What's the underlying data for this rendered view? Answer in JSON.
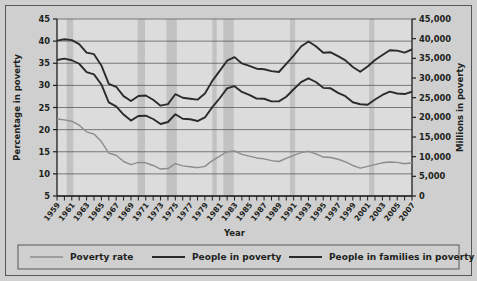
{
  "figure": {
    "background_color": "#cfcfcf",
    "plot_background_color": "#dcdcdc",
    "recession_band_color": "#c2c2c2",
    "frame_color": "#55585a"
  },
  "chart_data": {
    "type": "line",
    "title": "",
    "xlabel": "Year",
    "ylabel": "Percentage in poverty",
    "y2label": "Millions in poverty",
    "grid": true,
    "legend_position": "bottom",
    "xlim": [
      1959,
      2007
    ],
    "ylim": [
      5,
      45
    ],
    "y2lim": [
      0,
      45000
    ],
    "ytick_labels": [
      "45",
      "40",
      "35",
      "30",
      "25",
      "20",
      "15",
      "10",
      "5"
    ],
    "ytick_values": [
      45,
      40,
      35,
      30,
      25,
      20,
      15,
      10,
      5
    ],
    "y2tick_labels": [
      "45,000",
      "40,000",
      "35,000",
      "30,000",
      "25,000",
      "20,000",
      "15,000",
      "10,000",
      "5,000",
      "0"
    ],
    "y2tick_values": [
      45000,
      40000,
      35000,
      30000,
      25000,
      20000,
      15000,
      10000,
      5000,
      0
    ],
    "x": [
      1959,
      1960,
      1961,
      1962,
      1963,
      1964,
      1965,
      1966,
      1967,
      1968,
      1969,
      1970,
      1971,
      1972,
      1973,
      1974,
      1975,
      1976,
      1977,
      1978,
      1979,
      1980,
      1981,
      1982,
      1983,
      1984,
      1985,
      1986,
      1987,
      1988,
      1989,
      1990,
      1991,
      1992,
      1993,
      1994,
      1995,
      1996,
      1997,
      1998,
      1999,
      2000,
      2001,
      2002,
      2003,
      2004,
      2005,
      2006,
      2007
    ],
    "xtick_labels": [
      "1959",
      "1961",
      "1963",
      "1965",
      "1967",
      "1969",
      "1971",
      "1973",
      "1975",
      "1977",
      "1979",
      "1981",
      "1983",
      "1985",
      "1987",
      "1989",
      "1991",
      "1993",
      "1995",
      "1997",
      "1999",
      "2001",
      "2003",
      "2005",
      "2007"
    ],
    "series": [
      {
        "name": "Poverty rate",
        "axis": "left",
        "units": "percent",
        "color": "#8c8c8c",
        "line_width": 1.4,
        "values": [
          22.4,
          22.2,
          21.9,
          21.0,
          19.5,
          19.0,
          17.3,
          14.7,
          14.2,
          12.8,
          12.1,
          12.6,
          12.5,
          11.9,
          11.1,
          11.2,
          12.3,
          11.8,
          11.6,
          11.4,
          11.7,
          13.0,
          14.0,
          15.0,
          15.2,
          14.4,
          14.0,
          13.6,
          13.4,
          13.0,
          12.8,
          13.5,
          14.2,
          14.8,
          15.1,
          14.5,
          13.8,
          13.7,
          13.3,
          12.7,
          11.9,
          11.3,
          11.7,
          12.1,
          12.5,
          12.7,
          12.6,
          12.3,
          12.5
        ]
      },
      {
        "name": "People in poverty",
        "axis": "right",
        "units": "thousands",
        "color": "#2b2b2b",
        "line_width": 1.9,
        "values": [
          39490,
          39851,
          39628,
          38625,
          36436,
          36055,
          33185,
          28510,
          27769,
          25389,
          24147,
          25420,
          25559,
          24460,
          22973,
          23370,
          25877,
          24975,
          24720,
          24497,
          26072,
          29272,
          31822,
          34398,
          35303,
          33700,
          33064,
          32370,
          32221,
          31745,
          31528,
          33585,
          35708,
          38014,
          39265,
          38059,
          36425,
          36529,
          35574,
          34476,
          32791,
          31581,
          32907,
          34570,
          35861,
          37040,
          36950,
          36460,
          37276
        ]
      },
      {
        "name": "People in families in poverty",
        "axis": "right",
        "units": "thousands",
        "color": "#2b2b2b",
        "line_width": 1.9,
        "values": [
          34562,
          34925,
          34509,
          33623,
          31498,
          30912,
          28358,
          23809,
          22771,
          20695,
          19175,
          20330,
          20405,
          19577,
          18299,
          18817,
          20789,
          19632,
          19505,
          19062,
          19964,
          22601,
          24850,
          27349,
          27933,
          26458,
          25729,
          24754,
          24725,
          24048,
          24066,
          25232,
          27143,
          28961,
          29927,
          28985,
          27501,
          27376,
          26217,
          25370,
          23830,
          23317,
          23215,
          24534,
          25684,
          26544,
          26068,
          25915,
          26509
        ]
      }
    ],
    "recession_bands": [
      {
        "start": 1960.3,
        "end": 1961.2,
        "label": "1960-61 recession"
      },
      {
        "start": 1969.9,
        "end": 1970.9,
        "label": "1969-70 recession"
      },
      {
        "start": 1973.8,
        "end": 1975.2,
        "label": "1973-75 recession"
      },
      {
        "start": 1980.0,
        "end": 1980.6,
        "label": "1980 recession"
      },
      {
        "start": 1981.5,
        "end": 1982.9,
        "label": "1981-82 recession"
      },
      {
        "start": 1990.5,
        "end": 1991.2,
        "label": "1990-91 recession"
      },
      {
        "start": 2001.2,
        "end": 2001.9,
        "label": "2001 recession"
      }
    ]
  },
  "legend": {
    "items": [
      {
        "label": "Poverty rate",
        "color": "#8c8c8c",
        "line_width": 1.4
      },
      {
        "label": "People in poverty",
        "color": "#2b2b2b",
        "line_width": 2.0
      },
      {
        "label": "People in families in poverty",
        "color": "#2b2b2b",
        "line_width": 2.0
      }
    ]
  }
}
